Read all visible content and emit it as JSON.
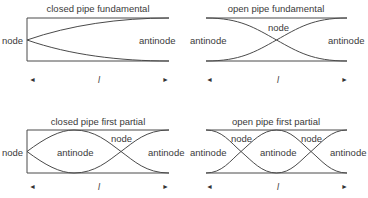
{
  "panels": [
    {
      "title": "closed pipe fundamental",
      "labels": {
        "left": "node",
        "right": "antinode"
      },
      "length_label": "l"
    },
    {
      "title": "open pipe fundamental",
      "labels": {
        "left": "antinode",
        "middle": "node",
        "right": "antinode"
      },
      "length_label": "l"
    },
    {
      "title": "closed pipe first partial",
      "labels": {
        "left": "node",
        "inner_antinode": "antinode",
        "middle": "node",
        "right": "antinode"
      },
      "length_label": "l"
    },
    {
      "title": "open pipe first partial",
      "labels": {
        "left": "antinode",
        "node1": "node",
        "inner_antinode": "antinode",
        "node2": "node",
        "right": "antinode"
      },
      "length_label": "l"
    }
  ],
  "arrows": {
    "left": "◄",
    "right": "►"
  },
  "colors": {
    "line": "#4a4a4a",
    "text": "#3a3a3a",
    "background": "#ffffff"
  }
}
